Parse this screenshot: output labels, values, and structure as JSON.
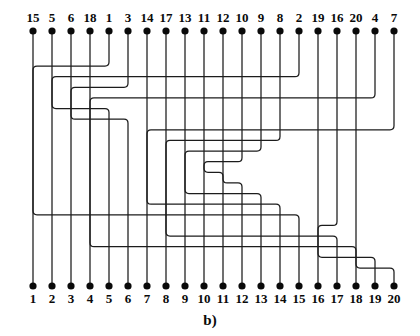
{
  "figure": {
    "caption": "b)",
    "kind": "permutation-wiring-diagram",
    "terminal_count": 20,
    "ink_color": "#1c1c1c",
    "dot_color": "#0a0a0a",
    "background_color": "#ffffff"
  },
  "geometry": {
    "width": 420,
    "height": 336,
    "first_terminal_x": 33,
    "terminal_spacing": 19,
    "top_dot_y": 31,
    "bottom_dot_y": 286,
    "top_label_y": 22,
    "bottom_label_y": 303,
    "caption_x": 210,
    "caption_y": 325,
    "dot_radius": 3.6,
    "corner_radius": 4,
    "track_top_y": 66,
    "track_bottom_y": 268,
    "track_count": 20
  },
  "top_terminals": {
    "labels": [
      "15",
      "5",
      "6",
      "18",
      "1",
      "3",
      "14",
      "17",
      "13",
      "11",
      "12",
      "10",
      "9",
      "8",
      "2",
      "19",
      "16",
      "20",
      "4",
      "7"
    ]
  },
  "bottom_terminals": {
    "labels": [
      "1",
      "2",
      "3",
      "4",
      "5",
      "6",
      "7",
      "8",
      "9",
      "10",
      "11",
      "12",
      "13",
      "14",
      "15",
      "16",
      "17",
      "18",
      "19",
      "20"
    ]
  },
  "chart_data": {
    "type": "table",
    "title": "b)",
    "xlabel": "",
    "ylabel": "",
    "columns": [
      "top_position",
      "top_label",
      "bottom_position",
      "bottom_label"
    ],
    "rows": [
      [
        1,
        "15",
        15,
        "15"
      ],
      [
        2,
        "5",
        5,
        "5"
      ],
      [
        3,
        "6",
        6,
        "6"
      ],
      [
        4,
        "18",
        18,
        "18"
      ],
      [
        5,
        "1",
        1,
        "1"
      ],
      [
        6,
        "3",
        3,
        "3"
      ],
      [
        7,
        "14",
        14,
        "14"
      ],
      [
        8,
        "17",
        17,
        "17"
      ],
      [
        9,
        "13",
        13,
        "13"
      ],
      [
        10,
        "11",
        11,
        "11"
      ],
      [
        11,
        "12",
        12,
        "12"
      ],
      [
        12,
        "10",
        10,
        "10"
      ],
      [
        13,
        "9",
        9,
        "9"
      ],
      [
        14,
        "8",
        8,
        "8"
      ],
      [
        15,
        "2",
        2,
        "2"
      ],
      [
        16,
        "19",
        19,
        "19"
      ],
      [
        17,
        "16",
        16,
        "16"
      ],
      [
        18,
        "20",
        20,
        "20"
      ],
      [
        19,
        "4",
        4,
        "4"
      ],
      [
        20,
        "7",
        7,
        "7"
      ]
    ],
    "permutation": [
      15,
      5,
      6,
      18,
      1,
      3,
      14,
      17,
      13,
      11,
      12,
      10,
      9,
      8,
      2,
      19,
      16,
      20,
      4,
      7
    ],
    "track_assignment": [
      14,
      4,
      5,
      17,
      0,
      2,
      13,
      16,
      12,
      10,
      11,
      9,
      8,
      7,
      1,
      18,
      15,
      19,
      3,
      6
    ]
  }
}
